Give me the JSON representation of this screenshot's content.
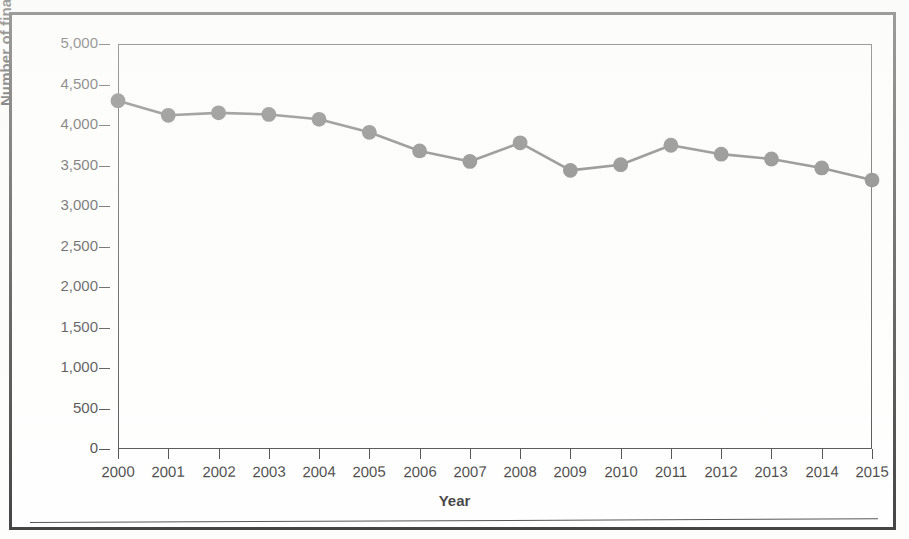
{
  "figure": {
    "background_color": "#ffffff",
    "border_color": "#151515"
  },
  "chart_data": {
    "type": "line",
    "title": "",
    "subtitle": "",
    "xlabel": "Year",
    "ylabel": "Number of final rules",
    "categories": [
      "2000",
      "2001",
      "2002",
      "2003",
      "2004",
      "2005",
      "2006",
      "2007",
      "2008",
      "2009",
      "2010",
      "2011",
      "2012",
      "2013",
      "2014",
      "2015"
    ],
    "x": [
      2000,
      2001,
      2002,
      2003,
      2004,
      2005,
      2006,
      2007,
      2008,
      2009,
      2010,
      2011,
      2012,
      2013,
      2014,
      2015
    ],
    "values": [
      4300,
      4120,
      4150,
      4130,
      4070,
      3910,
      3680,
      3550,
      3780,
      3440,
      3510,
      3750,
      3640,
      3580,
      3470,
      3320
    ],
    "series": [
      {
        "name": "Number of final rules",
        "color": "#4a4a4a",
        "marker": "circle",
        "values": [
          4300,
          4120,
          4150,
          4130,
          4070,
          3910,
          3680,
          3550,
          3780,
          3440,
          3510,
          3750,
          3640,
          3580,
          3470,
          3320
        ]
      }
    ],
    "ylim": [
      0,
      5000
    ],
    "ytick_values": [
      0,
      500,
      1000,
      1500,
      2000,
      2500,
      3000,
      3500,
      4000,
      4500,
      5000
    ],
    "ytick_labels": [
      "0",
      "500",
      "1,000",
      "1,500",
      "2,000",
      "2,500",
      "3,000",
      "3,500",
      "4,000",
      "4,500",
      "5,000"
    ],
    "xlim": [
      2000,
      2015
    ],
    "grid": false,
    "legend": false,
    "legend_position": "none"
  }
}
